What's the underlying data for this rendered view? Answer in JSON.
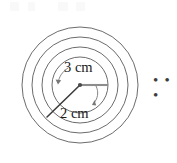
{
  "figure": {
    "kind": "concentric-circles-diagram",
    "canvas": {
      "width": 177,
      "height": 163,
      "background": "#ffffff"
    },
    "center": {
      "x": 80,
      "y": 85
    },
    "stroke_color": "#5a5a5a",
    "label_color": "#1b1b1b",
    "rings": [
      {
        "name": "innermost-circle",
        "radius_px": 28
      },
      {
        "name": "second-circle",
        "radius_px": 38
      },
      {
        "name": "third-circle",
        "radius_px": 48
      },
      {
        "name": "outermost-circle",
        "radius_px": 58
      }
    ],
    "radii_markers": [
      {
        "name": "inner-radius-marker",
        "label": "3 cm",
        "direction": "right-horizontal",
        "color": "#8c8c8c",
        "length_px": 28
      },
      {
        "name": "spacing-marker",
        "label": "2 cm",
        "direction": "lower-left-diagonal",
        "color": "#3a3a3a",
        "length_px": 46
      }
    ],
    "labels": {
      "inner_radius": "3 cm",
      "ring_spacing": "2 cm"
    },
    "continuation": {
      "name": "ellipsis",
      "text": "…",
      "glyph": "• • •"
    }
  }
}
